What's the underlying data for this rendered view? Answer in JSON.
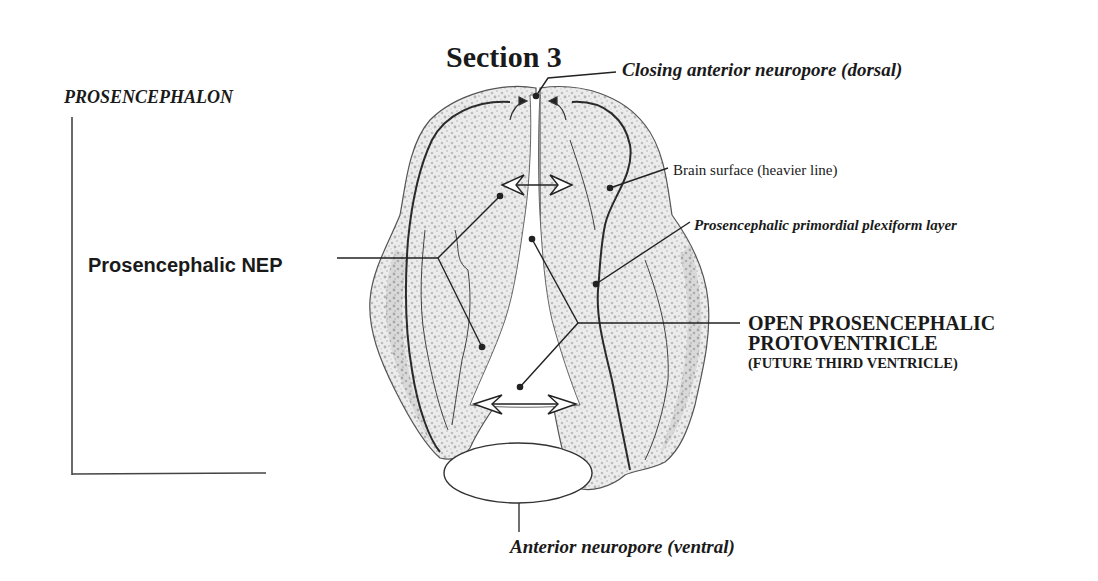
{
  "title": "Section 3",
  "region_label": "PROSENCEPHALON",
  "labels": {
    "closing_neuropore": "Closing anterior neuropore (dorsal)",
    "brain_surface": "Brain surface (heavier line)",
    "plexiform_layer": "Prosencephalic primordial plexiform layer",
    "nep": "Prosencephalic NEP",
    "protoventricle_line1": "OPEN PROSENCEPHALIC",
    "protoventricle_line2": "PROTOVENTRICLE",
    "protoventricle_line3": "(FUTURE THIRD VENTRICLE)",
    "anterior_neuropore_ventral": "Anterior neuropore (ventral)"
  },
  "colors": {
    "ink": "#1a1a1a",
    "tissue_fill": "#e6e6e6",
    "tissue_stipple": "#b5b5b5",
    "background": "#ffffff"
  }
}
